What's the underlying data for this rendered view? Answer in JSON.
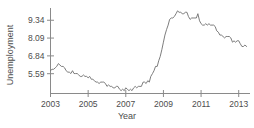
{
  "chart_data": {
    "type": "line",
    "title": "",
    "xlabel": "Year",
    "ylabel": "Unemployment",
    "xlim": [
      2003.0,
      2013.6
    ],
    "ylim": [
      4.2,
      10.2
    ],
    "grid": false,
    "legend": "none",
    "line_color": "#6e6e6e",
    "axis_color": "#8a8a8a",
    "xticks": [
      2003,
      2005,
      2007,
      2009,
      2011,
      2013
    ],
    "xtick_labels": [
      "2003",
      "2005",
      "2007",
      "2009",
      "2011",
      "2013"
    ],
    "yticks": [
      5.59,
      6.84,
      8.09,
      9.34
    ],
    "ytick_labels": [
      "5.59",
      "6.84",
      "8.09",
      "9.34"
    ],
    "series": [
      {
        "name": "Unemployment",
        "x": [
          2003.0,
          2003.08,
          2003.17,
          2003.25,
          2003.33,
          2003.42,
          2003.5,
          2003.58,
          2003.67,
          2003.75,
          2003.83,
          2003.92,
          2004.0,
          2004.08,
          2004.17,
          2004.25,
          2004.33,
          2004.42,
          2004.5,
          2004.58,
          2004.67,
          2004.75,
          2004.83,
          2004.92,
          2005.0,
          2005.08,
          2005.17,
          2005.25,
          2005.33,
          2005.42,
          2005.5,
          2005.58,
          2005.67,
          2005.75,
          2005.83,
          2005.92,
          2006.0,
          2006.08,
          2006.17,
          2006.25,
          2006.33,
          2006.42,
          2006.5,
          2006.58,
          2006.67,
          2006.75,
          2006.83,
          2006.92,
          2007.0,
          2007.08,
          2007.17,
          2007.25,
          2007.33,
          2007.42,
          2007.5,
          2007.58,
          2007.67,
          2007.75,
          2007.83,
          2007.92,
          2008.0,
          2008.08,
          2008.17,
          2008.25,
          2008.33,
          2008.42,
          2008.5,
          2008.58,
          2008.67,
          2008.75,
          2008.83,
          2008.92,
          2009.0,
          2009.08,
          2009.17,
          2009.25,
          2009.33,
          2009.42,
          2009.5,
          2009.58,
          2009.67,
          2009.75,
          2009.83,
          2009.92,
          2010.0,
          2010.08,
          2010.17,
          2010.25,
          2010.33,
          2010.42,
          2010.5,
          2010.58,
          2010.67,
          2010.75,
          2010.83,
          2010.92,
          2011.0,
          2011.08,
          2011.17,
          2011.25,
          2011.33,
          2011.42,
          2011.5,
          2011.58,
          2011.67,
          2011.75,
          2011.83,
          2011.92,
          2012.0,
          2012.08,
          2012.17,
          2012.25,
          2012.33,
          2012.42,
          2012.5,
          2012.58,
          2012.67,
          2012.75,
          2012.83,
          2012.92,
          2013.0,
          2013.08,
          2013.17,
          2013.25,
          2013.33,
          2013.42
        ],
        "values": [
          5.8,
          5.9,
          5.9,
          6.0,
          6.1,
          6.3,
          6.2,
          6.1,
          6.1,
          6.0,
          5.8,
          5.7,
          5.7,
          5.6,
          5.8,
          5.6,
          5.6,
          5.6,
          5.5,
          5.4,
          5.4,
          5.5,
          5.4,
          5.4,
          5.3,
          5.4,
          5.2,
          5.2,
          5.1,
          5.0,
          5.0,
          4.9,
          5.0,
          5.0,
          5.0,
          4.9,
          4.7,
          4.8,
          4.7,
          4.7,
          4.6,
          4.6,
          4.7,
          4.7,
          4.5,
          4.4,
          4.5,
          4.4,
          4.6,
          4.5,
          4.4,
          4.5,
          4.4,
          4.6,
          4.7,
          4.6,
          4.7,
          4.7,
          4.7,
          5.0,
          5.0,
          4.9,
          5.1,
          5.0,
          5.4,
          5.6,
          5.8,
          6.1,
          6.1,
          6.5,
          6.8,
          7.3,
          7.8,
          8.3,
          8.7,
          9.0,
          9.4,
          9.5,
          9.5,
          9.6,
          9.8,
          10.0,
          9.9,
          9.9,
          9.8,
          9.8,
          9.9,
          9.9,
          9.6,
          9.4,
          9.5,
          9.5,
          9.5,
          9.5,
          9.8,
          9.3,
          9.1,
          9.0,
          9.0,
          9.1,
          9.0,
          9.1,
          9.0,
          9.0,
          9.0,
          8.9,
          8.6,
          8.5,
          8.3,
          8.3,
          8.2,
          8.1,
          8.2,
          8.2,
          8.2,
          8.1,
          7.8,
          7.9,
          7.8,
          7.9,
          7.9,
          7.7,
          7.5,
          7.5,
          7.6,
          7.5
        ]
      }
    ]
  },
  "axis_titles": {
    "y": "Unemployment",
    "x": "Year"
  }
}
